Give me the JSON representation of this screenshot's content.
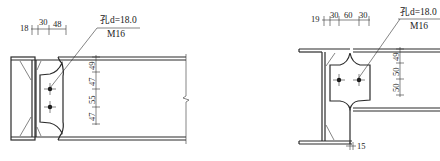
{
  "left_detail": {
    "top_dims": [
      "18",
      "30",
      "48"
    ],
    "hole_label": "孔d=18.0",
    "bolt_label": "M16",
    "side_dims": [
      "49",
      "47",
      "55",
      "47"
    ]
  },
  "right_detail": {
    "top_dims": [
      "19",
      "30",
      "60",
      "30"
    ],
    "hole_label": "孔d=18.0",
    "bolt_label": "M16",
    "side_dims": [
      "49",
      "50",
      "50"
    ],
    "bottom_dim": "15"
  },
  "colors": {
    "line": "#2a2a2a",
    "background": "#ffffff"
  }
}
